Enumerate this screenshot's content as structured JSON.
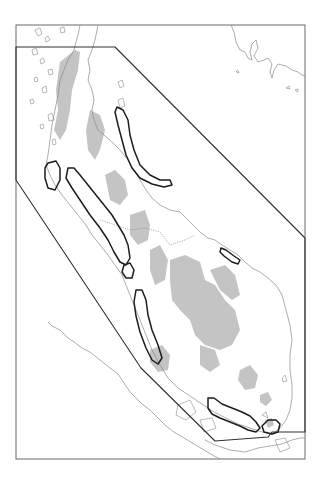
{
  "figure": {
    "type": "map",
    "frame": {
      "x": 16,
      "y": 25,
      "width": 289,
      "height": 434
    },
    "colors": {
      "frame": "#6a6a6a",
      "coastline": "#8a8a8a",
      "highland_shading": "#c4c4c4",
      "boundary_polygon": "#303030",
      "outlined_zones": "#1c1c1c",
      "background": "#ffffff"
    },
    "boundary_polygon": [
      [
        16,
        47
      ],
      [
        115,
        47
      ],
      [
        305,
        238
      ],
      [
        305,
        432
      ],
      [
        272,
        432
      ],
      [
        268,
        437
      ],
      [
        215,
        441
      ],
      [
        141,
        368
      ],
      [
        16,
        180
      ]
    ],
    "outlined_zones": [
      {
        "name": "west-island-zone",
        "approx_center": [
          50,
          176
        ]
      },
      {
        "name": "west-coast-strip-north",
        "approx_center": [
          100,
          225
        ]
      },
      {
        "name": "west-coast-small-loop",
        "approx_center": [
          127,
          268
        ]
      },
      {
        "name": "west-coast-strip-south",
        "approx_center": [
          150,
          320
        ]
      },
      {
        "name": "east-coast-strip-north",
        "approx_center": [
          135,
          165
        ]
      },
      {
        "name": "east-coast-small-islet-zone",
        "approx_center": [
          230,
          255
        ]
      },
      {
        "name": "south-coast-strip",
        "approx_center": [
          240,
          410
        ]
      },
      {
        "name": "southern-tip-zone",
        "approx_center": [
          275,
          428
        ]
      }
    ],
    "caption": ""
  }
}
